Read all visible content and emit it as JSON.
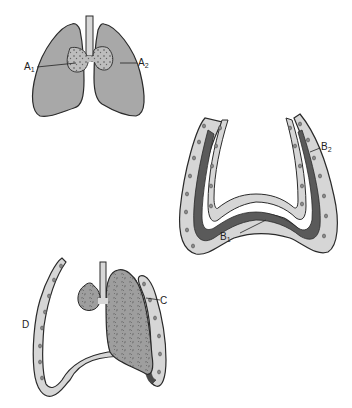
{
  "figure": {
    "panels": [
      {
        "id": "A",
        "description": "Normal lungs with trachea and hilar lymph nodes",
        "labels": [
          {
            "letter": "A",
            "sub": "1"
          },
          {
            "letter": "A",
            "sub": "2"
          }
        ]
      },
      {
        "id": "B",
        "description": "Pleural layers cross-section",
        "labels": [
          {
            "letter": "B",
            "sub": "1"
          },
          {
            "letter": "B",
            "sub": "2"
          }
        ]
      },
      {
        "id": "CD",
        "description": "Collapsed lung within pleural cavity",
        "labels": [
          {
            "letter": "C",
            "sub": ""
          },
          {
            "letter": "D",
            "sub": ""
          }
        ]
      }
    ],
    "colors": {
      "lung_fill": "#a8a8a8",
      "outline": "#2a2a2a",
      "pleura_light": "#d6d6d6",
      "pleura_dark": "#5a5a5a",
      "node_fill": "#9c9c9c",
      "dot": "#8a8a8a",
      "background": "#ffffff"
    }
  }
}
